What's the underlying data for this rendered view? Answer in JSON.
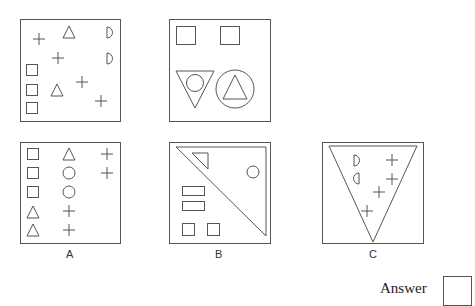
{
  "puzzle": {
    "question_panels": [
      {
        "id": "top-left",
        "contents": [
          "plus x4",
          "triangle x2",
          "half-circle (D) x2",
          "square x3"
        ]
      },
      {
        "id": "top-right",
        "contents": [
          "square x2",
          "inverted triangle containing circle",
          "circle containing triangle"
        ]
      }
    ],
    "options": [
      {
        "label": "A",
        "contents": [
          "square x3",
          "triangle x3",
          "circle x2",
          "plus x4"
        ]
      },
      {
        "label": "B",
        "contents": [
          "large diagonal triangle",
          "small triangle",
          "circle",
          "rectangle x2",
          "square x2"
        ]
      },
      {
        "label": "C",
        "contents": [
          "large inverted triangle",
          "half-circle x2",
          "plus x4"
        ]
      }
    ]
  },
  "answer": {
    "label": "Answer",
    "value": ""
  },
  "colors": {
    "stroke": "#555555",
    "background": "#ffffff"
  }
}
